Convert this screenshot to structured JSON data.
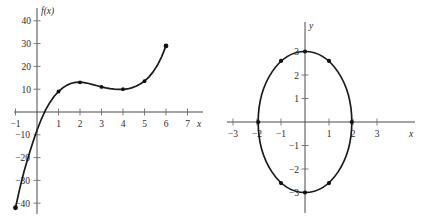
{
  "figure": {
    "panels": [
      "left-cubic-plot",
      "right-ellipse-plot"
    ]
  },
  "chart_data": [
    {
      "type": "line",
      "id": "left-cubic-plot",
      "title": "",
      "xlabel": "x",
      "ylabel": "f(x)",
      "grid": false,
      "legend": "none",
      "xlim": [
        -1.35,
        7.6
      ],
      "ylim": [
        -46,
        46
      ],
      "xticks": [
        -1,
        1,
        2,
        3,
        4,
        5,
        6,
        7
      ],
      "xticklabels": [
        "−1",
        "1",
        "2",
        "3",
        "4",
        "5",
        "6",
        "7"
      ],
      "yticks": [
        -40,
        -30,
        -20,
        -10,
        10,
        20,
        30,
        40
      ],
      "yticklabels": [
        "−40",
        "−30",
        "−20",
        "−10",
        "10",
        "20",
        "30",
        "40"
      ],
      "markers": {
        "x": [
          -1,
          1,
          2,
          3,
          4,
          5,
          6
        ],
        "y": [
          -42,
          9,
          13,
          11,
          10,
          13.5,
          29
        ]
      },
      "curve_points": {
        "x": [
          -1,
          -0.8,
          -0.6,
          -0.4,
          -0.2,
          0,
          0.2,
          0.4,
          0.6,
          0.8,
          1,
          1.2,
          1.4,
          1.6,
          1.8,
          2,
          2.2,
          2.4,
          2.6,
          2.8,
          3,
          3.2,
          3.4,
          3.6,
          3.8,
          4,
          4.2,
          4.4,
          4.6,
          4.8,
          5,
          5.2,
          5.4,
          5.6,
          5.8,
          6
        ],
        "y": [
          -42,
          -33.5,
          -26,
          -19.5,
          -13.5,
          -8,
          -3.2,
          0.9,
          4.2,
          6.9,
          9,
          10.6,
          11.8,
          12.6,
          13.0,
          13.1,
          12.9,
          12.5,
          12.0,
          11.5,
          11.0,
          10.6,
          10.25,
          10.0,
          9.9,
          9.9,
          10.1,
          10.6,
          11.3,
          12.3,
          13.5,
          15.3,
          17.6,
          20.5,
          24.3,
          29
        ]
      }
    },
    {
      "type": "scatter",
      "id": "right-ellipse-plot",
      "title": "",
      "xlabel": "x",
      "ylabel": "y",
      "grid": false,
      "legend": "none",
      "xlim": [
        -3.9,
        4.4
      ],
      "ylim": [
        -3.9,
        3.7
      ],
      "xticks": [
        -3,
        -2,
        -1,
        1,
        2,
        3
      ],
      "xticklabels": [
        "−3",
        "−2",
        "−1",
        "1",
        "2",
        "3"
      ],
      "yticks": [
        -3,
        -2,
        -1,
        1,
        2,
        3
      ],
      "yticklabels": [
        "−3",
        "−2",
        "−1",
        "1",
        "2",
        "3"
      ],
      "shape": "ellipse",
      "semi_axis_x": 1.95,
      "semi_axis_y": 3.0,
      "markers": {
        "x": [
          0,
          1,
          1.95,
          1,
          0,
          -1,
          -1.95,
          -1
        ],
        "y": [
          3,
          2.6,
          0,
          -2.6,
          -3,
          -2.6,
          0,
          2.6
        ]
      }
    }
  ],
  "labels": {
    "left": {
      "y_axis_label": "f(x)",
      "x_axis_label": "x"
    },
    "right": {
      "y_axis_label": "y",
      "x_axis_label": "x"
    }
  },
  "captions": {
    "left": "",
    "right": ""
  }
}
